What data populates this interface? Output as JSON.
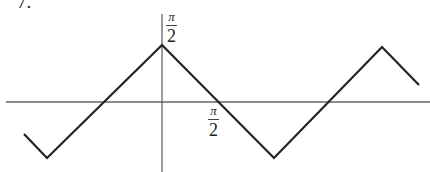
{
  "problem_number": "7.",
  "labels": {
    "y_tick": {
      "numerator": "π",
      "denominator": "2"
    },
    "x_tick": {
      "numerator": "π",
      "denominator": "2"
    }
  },
  "colors": {
    "line": "#222222",
    "axis": "#555555",
    "background": "#ffffff"
  },
  "chart_data": {
    "type": "line",
    "title": "",
    "xlabel": "",
    "ylabel": "",
    "x_tick_labels": [
      "π/2"
    ],
    "y_tick_labels": [
      "π/2"
    ],
    "grid": false,
    "legend": null,
    "xlim": [
      -4.4,
      6.7
    ],
    "ylim": [
      -2.2,
      2.8
    ],
    "series": [
      {
        "name": "f(x)",
        "x": [
          -3.85,
          -3.14,
          0,
          3.14,
          6.1,
          7.1
        ],
        "y": [
          -0.9,
          -1.57,
          1.57,
          -1.57,
          1.57,
          0.5
        ]
      }
    ],
    "pixel_polyline": [
      [
        24,
        134
      ],
      [
        47,
        158
      ],
      [
        162,
        45
      ],
      [
        274,
        158
      ],
      [
        382,
        47
      ],
      [
        419,
        85
      ]
    ],
    "axes_pixels": {
      "x_axis_y": 102,
      "x_axis_x": [
        6,
        430
      ],
      "y_axis_x": 162,
      "y_axis_y": [
        14,
        172
      ]
    }
  }
}
